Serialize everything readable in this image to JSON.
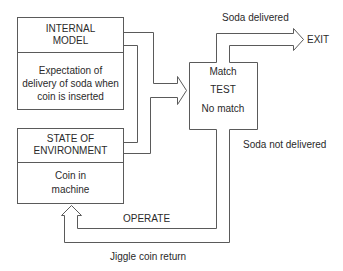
{
  "diagram": {
    "internal_model": {
      "title_line1": "INTERNAL",
      "title_line2": "MODEL",
      "body_line1": "Expectation of",
      "body_line2": "delivery of soda when",
      "body_line3": "coin is inserted"
    },
    "state_of_environment": {
      "title_line1": "STATE OF",
      "title_line2": "ENVIRONMENT",
      "body_line1": "Coin in",
      "body_line2": "machine"
    },
    "test_box": {
      "match": "Match",
      "test": "TEST",
      "no_match": "No match"
    },
    "labels": {
      "soda_delivered": "Soda delivered",
      "exit": "EXIT",
      "soda_not_delivered": "Soda not delivered",
      "operate": "OPERATE",
      "jiggle_coin_return": "Jiggle coin return"
    },
    "colors": {
      "line": "#5a5a5a",
      "text": "#2a2a2a",
      "background": "#ffffff"
    }
  }
}
